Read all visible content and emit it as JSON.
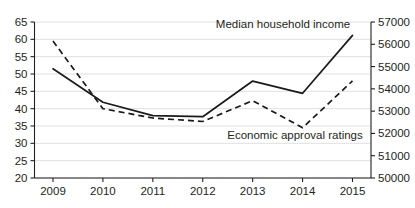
{
  "chart_data": {
    "type": "line",
    "title": "",
    "xlabel": "",
    "ylabel": "",
    "grid": true,
    "legend_position": "inline-annotation",
    "categories": [
      "2009",
      "2010",
      "2011",
      "2012",
      "2013",
      "2014",
      "2015"
    ],
    "x_tick_labels": [
      "2009",
      "2010",
      "2011",
      "2012",
      "2013",
      "2014",
      "2015"
    ],
    "left_axis": {
      "ylim": [
        20,
        65
      ],
      "tick_step": 5,
      "tick_labels": [
        "20",
        "25",
        "30",
        "35",
        "40",
        "45",
        "50",
        "55",
        "60",
        "65"
      ],
      "tick_values": [
        20,
        25,
        30,
        35,
        40,
        45,
        50,
        55,
        60,
        65
      ]
    },
    "right_axis": {
      "ylim": [
        50000,
        57000
      ],
      "tick_step": 1000,
      "tick_labels": [
        "50000",
        "51000",
        "52000",
        "53000",
        "54000",
        "55000",
        "56000",
        "57000"
      ],
      "tick_values": [
        50000,
        51000,
        52000,
        53000,
        54000,
        55000,
        56000,
        57000
      ]
    },
    "series": [
      {
        "name": "Median household income",
        "label": "Median household income",
        "style": "solid",
        "axis": "right",
        "color": "#1a1a1a",
        "values": [
          54900,
          53400,
          52800,
          52750,
          54350,
          53800,
          56400
        ]
      },
      {
        "name": "Economic approval ratings",
        "label": "Economic approval ratings",
        "style": "dashed",
        "axis": "left",
        "color": "#1a1a1a",
        "values": [
          59.5,
          40.0,
          37.3,
          36.3,
          42.3,
          34.5,
          48.0
        ]
      }
    ],
    "annotations": [
      {
        "text": "Median household income",
        "x_px": 283,
        "y_px": 28
      },
      {
        "text": "Economic approval ratings",
        "x_px": 295,
        "y_px": 139
      }
    ]
  }
}
